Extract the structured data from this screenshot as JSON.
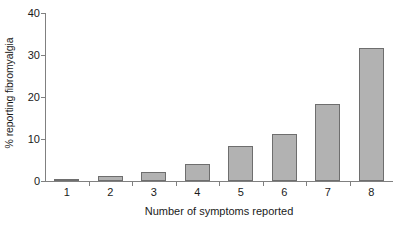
{
  "chart_data": {
    "type": "bar",
    "title": "",
    "xlabel": "Number of symptoms reported",
    "ylabel": "% reporting fibromyalgia",
    "categories": [
      "1",
      "2",
      "3",
      "4",
      "5",
      "6",
      "7",
      "8"
    ],
    "values": [
      0.5,
      1.2,
      2.2,
      4.0,
      8.3,
      11.2,
      18.3,
      31.7
    ],
    "ylim": [
      0,
      40
    ],
    "yticks": [
      0,
      10,
      20,
      30,
      40
    ],
    "ytick_labels": [
      "0",
      "10",
      "20",
      "30",
      "40"
    ],
    "grid": false,
    "legend": null,
    "bar_fill_color": "#b2b2b2",
    "bar_border_color": "#6e6e6e",
    "axis_color": "#808080",
    "text_color": "#1a1a1a"
  }
}
